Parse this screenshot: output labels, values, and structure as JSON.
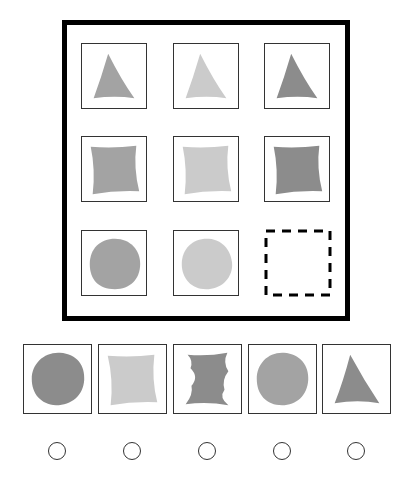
{
  "puzzle": {
    "colors": {
      "medium": "#a3a3a3",
      "light": "#cbcbcb",
      "dark": "#8c8c8c",
      "frame": "#000000",
      "cell_border": "#333333"
    },
    "grid": [
      [
        {
          "shape": "triangle",
          "shade": "medium"
        },
        {
          "shape": "triangle",
          "shade": "light"
        },
        {
          "shape": "triangle",
          "shade": "dark"
        }
      ],
      [
        {
          "shape": "square",
          "shade": "medium"
        },
        {
          "shape": "square",
          "shade": "light"
        },
        {
          "shape": "square",
          "shade": "dark"
        }
      ],
      [
        {
          "shape": "circle",
          "shade": "medium"
        },
        {
          "shape": "circle",
          "shade": "light"
        },
        {
          "shape": "missing",
          "shade": null
        }
      ]
    ],
    "options": [
      {
        "index": 1,
        "shape": "circle",
        "shade": "dark"
      },
      {
        "index": 2,
        "shape": "square",
        "shade": "light"
      },
      {
        "index": 3,
        "shape": "hourglass-wave",
        "shade": "dark"
      },
      {
        "index": 4,
        "shape": "circle",
        "shade": "medium"
      },
      {
        "index": 5,
        "shape": "triangle",
        "shade": "dark"
      }
    ],
    "answer_choices": 5
  }
}
